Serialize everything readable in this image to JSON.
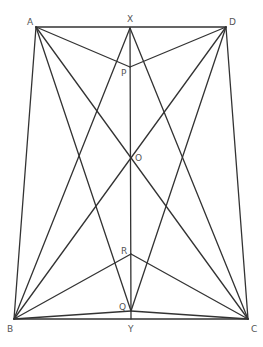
{
  "diagram": {
    "type": "geometric-figure",
    "colors": {
      "line": "#333333",
      "label": "#555555",
      "background": "#ffffff"
    },
    "points": [
      {
        "id": "A",
        "x": 36,
        "y": 27,
        "label": "A",
        "lx": 27,
        "ly": 25
      },
      {
        "id": "X",
        "x": 130,
        "y": 28,
        "label": "X",
        "lx": 127,
        "ly": 22
      },
      {
        "id": "D",
        "x": 226,
        "y": 27,
        "label": "D",
        "lx": 229,
        "ly": 25
      },
      {
        "id": "P",
        "x": 130,
        "y": 67,
        "label": "P",
        "lx": 121,
        "ly": 76
      },
      {
        "id": "O",
        "x": 130,
        "y": 156,
        "label": "O",
        "lx": 135,
        "ly": 161
      },
      {
        "id": "R",
        "x": 131,
        "y": 254,
        "label": "R",
        "lx": 121,
        "ly": 254
      },
      {
        "id": "Q",
        "x": 131,
        "y": 311,
        "label": "Q",
        "lx": 119,
        "ly": 310
      },
      {
        "id": "B",
        "x": 14,
        "y": 319,
        "label": "B",
        "lx": 7,
        "ly": 332
      },
      {
        "id": "Y",
        "x": 131,
        "y": 319,
        "label": "Y",
        "lx": 128,
        "ly": 332
      },
      {
        "id": "C",
        "x": 248,
        "y": 319,
        "label": "C",
        "lx": 251,
        "ly": 332
      }
    ],
    "segments": [
      [
        "A",
        "D"
      ],
      [
        "A",
        "B"
      ],
      [
        "D",
        "C"
      ],
      [
        "B",
        "C"
      ],
      [
        "X",
        "Y"
      ],
      [
        "A",
        "P"
      ],
      [
        "D",
        "P"
      ],
      [
        "A",
        "C"
      ],
      [
        "D",
        "B"
      ],
      [
        "A",
        "Q"
      ],
      [
        "D",
        "Q"
      ],
      [
        "B",
        "X"
      ],
      [
        "C",
        "X"
      ],
      [
        "B",
        "R"
      ],
      [
        "C",
        "R"
      ],
      [
        "B",
        "Q"
      ],
      [
        "C",
        "Q"
      ]
    ]
  }
}
